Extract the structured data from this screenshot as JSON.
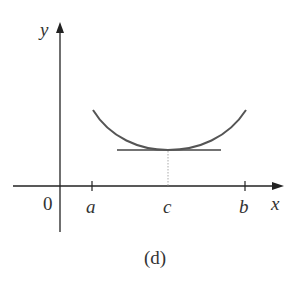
{
  "figure": {
    "caption": "(d)",
    "axes": {
      "x_label": "x",
      "y_label": "y",
      "origin_label": "0"
    },
    "ticks": [
      {
        "label": "a",
        "x": 92
      },
      {
        "label": "c",
        "x": 168
      },
      {
        "label": "b",
        "x": 245
      }
    ],
    "curve": {
      "description": "concave-up parabola-like curve with minimum at x = c",
      "left_end": [
        93,
        110
      ],
      "minimum": [
        168,
        150
      ],
      "right_end": [
        246,
        110
      ]
    },
    "tangent_line": {
      "description": "horizontal tangent at minimum point (c, f(c))",
      "x1": 117,
      "x2": 221,
      "y": 150
    },
    "dotted_guide": {
      "description": "dotted vertical line from minimum down to c on x-axis"
    },
    "colors": {
      "axis": "#222222",
      "curve": "#555555",
      "tangent": "#444444",
      "dotted": "#aaaaaa",
      "text": "#333333"
    }
  }
}
